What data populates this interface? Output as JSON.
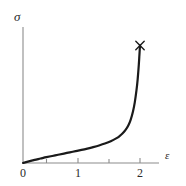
{
  "figure": {
    "width": 186,
    "height": 186,
    "background": "#ffffff"
  },
  "axes": {
    "y_axis_label": "σ",
    "x_axis_label": "ε",
    "axis_color": "#8c8c8c",
    "origin_label": "0"
  },
  "x_tick_labels": {
    "t0": "0",
    "t1": "1",
    "t2": "2"
  },
  "chart_data": {
    "type": "line",
    "title": "",
    "subtitle": "",
    "xlabel": "ε",
    "ylabel": "σ",
    "xlim": [
      0,
      2.2
    ],
    "ylim": [
      0,
      1.0
    ],
    "grid": false,
    "legend": null,
    "xticks": [
      0,
      0.5,
      1,
      1.5,
      2
    ],
    "xticklabels": [
      "0",
      "",
      "1",
      "",
      "2"
    ],
    "yticks": [],
    "yticklabels": [],
    "series": [
      {
        "name": "stress-strain",
        "color": "#1a1a1a",
        "linewidth": 2.2,
        "x": [
          0.0,
          0.1,
          0.2,
          0.3,
          0.4,
          0.5,
          0.6,
          0.7,
          0.8,
          0.9,
          1.0,
          1.1,
          1.2,
          1.3,
          1.4,
          1.5,
          1.6,
          1.65,
          1.7,
          1.75,
          1.8,
          1.84,
          1.88,
          1.91,
          1.94,
          1.96,
          1.98,
          1.99,
          2.0
        ],
        "y": [
          0.0,
          0.012,
          0.023,
          0.033,
          0.043,
          0.052,
          0.061,
          0.07,
          0.079,
          0.088,
          0.097,
          0.107,
          0.118,
          0.13,
          0.144,
          0.161,
          0.184,
          0.199,
          0.218,
          0.243,
          0.278,
          0.32,
          0.382,
          0.447,
          0.54,
          0.62,
          0.73,
          0.8,
          0.87
        ]
      }
    ],
    "annotations": [
      {
        "name": "failure-point-marker",
        "marker": "x",
        "x": 2.0,
        "y": 0.87,
        "color": "#1a1a1a",
        "label": ""
      }
    ]
  }
}
